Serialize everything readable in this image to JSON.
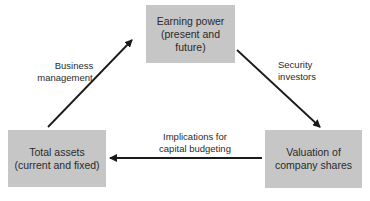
{
  "diagram": {
    "nodes": {
      "earning_power": {
        "line1": "Earning power",
        "line2": "(present and future)"
      },
      "total_assets": {
        "line1": "Total assets",
        "line2": "(current and fixed)"
      },
      "valuation": {
        "line1": "Valuation of",
        "line2": "company shares"
      }
    },
    "edges": {
      "business_management": {
        "line1": "Business",
        "line2": "management",
        "from": "total_assets",
        "to": "earning_power"
      },
      "security_investors": {
        "line1": "Security",
        "line2": "investors",
        "from": "earning_power",
        "to": "valuation"
      },
      "capital_budgeting": {
        "line1": "Implications for",
        "line2": "capital budgeting",
        "from": "valuation",
        "to": "total_assets"
      }
    },
    "colors": {
      "box_fill": "#c6c6c6",
      "arrow": "#1a1a1a",
      "text": "#2a2a2a"
    }
  }
}
